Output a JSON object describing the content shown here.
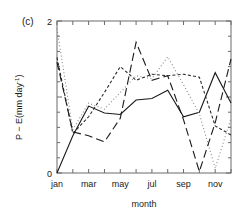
{
  "panel": {
    "label": "(c)"
  },
  "axes": {
    "y": {
      "title_main": "P − E(mm day",
      "title_sup": "-1",
      "title_tail": ")",
      "ticklabels": [
        "2",
        "0"
      ],
      "min": 0,
      "max": 2
    },
    "x": {
      "title": "month",
      "ticklabels": [
        "jan",
        "mar",
        "may",
        "jul",
        "sep",
        "nov"
      ]
    }
  },
  "chart_data": {
    "type": "line",
    "title": "(c)",
    "xlabel": "month",
    "ylabel": "P − E(mm day-1)",
    "ylim": [
      0,
      2
    ],
    "xlim": [
      1,
      12
    ],
    "grid": false,
    "legend": null,
    "categories": [
      "jan",
      "feb",
      "mar",
      "apr",
      "may",
      "jun",
      "jul",
      "aug",
      "sep",
      "oct",
      "nov",
      "dec"
    ],
    "x": [
      1,
      2,
      3,
      4,
      5,
      6,
      7,
      8,
      9,
      10,
      11,
      12
    ],
    "series": [
      {
        "name": "solid",
        "style": "solid",
        "color": "#1a1a1a",
        "values": [
          0.0,
          0.49,
          0.88,
          0.79,
          0.77,
          0.96,
          0.98,
          1.09,
          0.74,
          0.8,
          1.32,
          0.92
        ]
      },
      {
        "name": "fine-dotted",
        "style": "dotted",
        "color": "#8a8a8a",
        "values": [
          1.9,
          0.57,
          0.92,
          0.84,
          1.06,
          1.28,
          1.24,
          1.53,
          1.16,
          0.78,
          0.06,
          0.72
        ]
      },
      {
        "name": "short-dashed",
        "style": "dashed-short",
        "color": "#2b2b2b",
        "values": [
          1.52,
          0.52,
          0.74,
          1.06,
          1.4,
          1.22,
          1.3,
          1.28,
          1.3,
          1.26,
          0.62,
          0.5
        ]
      },
      {
        "name": "long-dashed",
        "style": "dashed-long",
        "color": "#1a1a1a",
        "values": [
          1.46,
          0.54,
          0.49,
          0.41,
          0.72,
          1.72,
          1.22,
          1.28,
          0.7,
          0.02,
          0.66,
          1.5
        ]
      }
    ]
  }
}
